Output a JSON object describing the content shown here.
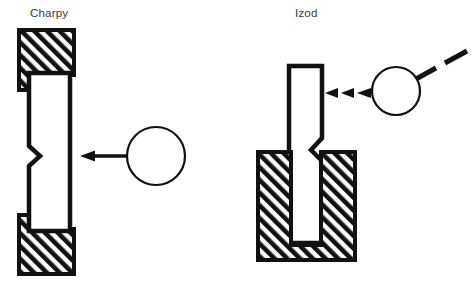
{
  "figure": {
    "title": "",
    "background_color": "#ffffff",
    "line_color": "#111111",
    "label_color": "#3a3a3a",
    "hatch_color": "#111111"
  },
  "panels": [
    {
      "id": "charpy",
      "label": "Charpy",
      "label_x": 30,
      "label_y": 17,
      "specimen": {
        "name": "charpy-specimen",
        "orientation": "vertical",
        "notch_side": "left",
        "notch_type": "v-notch",
        "notch_label": "V-notch"
      },
      "supports": [
        {
          "name": "charpy-upper-anvil",
          "hatched": true
        },
        {
          "name": "charpy-lower-anvil",
          "hatched": true
        }
      ],
      "striker": {
        "name": "charpy-striker",
        "shape": "circle",
        "cx": 156,
        "cy": 156,
        "r": 29,
        "filled": false
      },
      "arrow": {
        "name": "charpy-impact-arrow",
        "style": "solid",
        "direction": "left",
        "from_x": 128,
        "to_x": 80,
        "y": 156
      }
    },
    {
      "id": "izod",
      "label": "Izod",
      "label_x": 295,
      "label_y": 17,
      "specimen": {
        "name": "izod-specimen",
        "orientation": "vertical",
        "notch_side": "right",
        "notch_type": "v-notch",
        "notch_label": "V-notch"
      },
      "supports": [
        {
          "name": "izod-vise-clamp",
          "hatched": true
        }
      ],
      "striker": {
        "name": "izod-striker",
        "shape": "circle",
        "cx": 396,
        "cy": 91,
        "r": 24,
        "filled": false
      },
      "arrow": {
        "name": "izod-impact-arrow",
        "style": "dashed",
        "direction": "left",
        "from_x": 370,
        "to_x": 325,
        "y": 93
      },
      "swing_path": {
        "name": "izod-pendulum-path",
        "style": "dashed",
        "direction": "up-right"
      }
    }
  ]
}
